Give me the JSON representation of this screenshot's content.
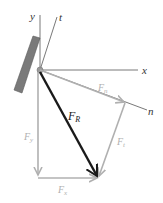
{
  "diagram": {
    "type": "force-vector-decomposition",
    "axes": {
      "x_label": "x",
      "y_label": "y",
      "t_label": "t",
      "n_label": "n"
    },
    "vectors": {
      "resultant": {
        "label": "F",
        "subscript": "R",
        "color": "#1a1a1a"
      },
      "normal": {
        "label": "F",
        "subscript": "n",
        "color": "#b0b0b0"
      },
      "tangent": {
        "label": "F",
        "subscript": "t",
        "color": "#b0b0b0"
      },
      "y_comp": {
        "label": "F",
        "subscript": "y",
        "color": "#b0b0b0"
      },
      "x_comp": {
        "label": "F",
        "subscript": "x",
        "color": "#b0b0b0"
      }
    },
    "colors": {
      "axis": "#555555",
      "plate": "#7a7a7a",
      "component": "#b0b0b0",
      "resultant": "#1a1a1a"
    }
  }
}
